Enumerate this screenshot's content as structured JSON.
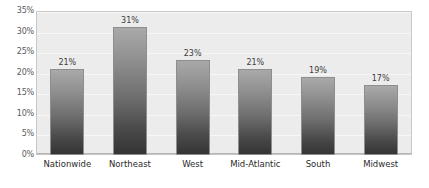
{
  "chart_data": {
    "type": "bar",
    "title": "",
    "xlabel": "",
    "ylabel": "",
    "categories": [
      "Nationwide",
      "Northeast",
      "West",
      "Mid-Atlantic",
      "South",
      "Midwest"
    ],
    "values": [
      21,
      31,
      23,
      21,
      19,
      17
    ],
    "value_labels": [
      "21%",
      "31%",
      "23%",
      "21%",
      "19%",
      "17%"
    ],
    "ylim": [
      0,
      35
    ],
    "ytick_values": [
      0,
      5,
      10,
      15,
      20,
      25,
      30,
      35
    ],
    "ytick_labels": [
      "0%",
      "5%",
      "10%",
      "15%",
      "20%",
      "25%",
      "30%",
      "35%"
    ],
    "grid": true,
    "legend": false,
    "legend_position": "none",
    "units": "percent",
    "colors": {
      "plot_background": "#ececec",
      "page_background": "#ffffff",
      "plot_border": "#c8c8c8",
      "gridline": "#f7f7f7",
      "bar_gradient_top": "#a9a9a9",
      "bar_gradient_bottom": "#343434",
      "bar_border": "#8e8e8e",
      "axis_text": "#5a5a5a",
      "category_text": "#2b2b2b",
      "value_text": "#3c3c3c"
    }
  }
}
